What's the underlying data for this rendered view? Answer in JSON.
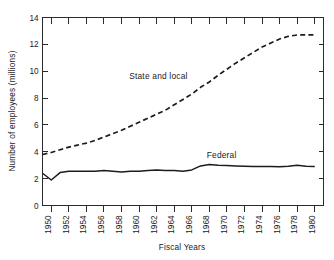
{
  "chart_data": {
    "type": "line",
    "title": "",
    "xlabel": "Fiscal Years",
    "ylabel": "Number of employees (millions)",
    "xlim": [
      1949,
      1981
    ],
    "ylim": [
      0,
      14
    ],
    "grid": false,
    "legend_position": "inline-annotation",
    "x_tick_labels": [
      "1950",
      "1952",
      "1954",
      "1956",
      "1958",
      "1960",
      "1962",
      "1964",
      "1966",
      "1968",
      "1970",
      "1972",
      "1974",
      "1976",
      "1978",
      "1980"
    ],
    "x_ticks": [
      1950,
      1952,
      1954,
      1956,
      1958,
      1960,
      1962,
      1964,
      1966,
      1968,
      1970,
      1972,
      1974,
      1976,
      1978,
      1980
    ],
    "y_tick_labels": [
      "0",
      "2",
      "4",
      "6",
      "8",
      "10",
      "12",
      "14"
    ],
    "y_ticks": [
      0,
      2,
      4,
      6,
      8,
      10,
      12,
      14
    ],
    "x": [
      1949,
      1950,
      1951,
      1952,
      1953,
      1954,
      1955,
      1956,
      1957,
      1958,
      1959,
      1960,
      1961,
      1962,
      1963,
      1964,
      1965,
      1966,
      1967,
      1968,
      1969,
      1970,
      1971,
      1972,
      1973,
      1974,
      1975,
      1976,
      1977,
      1978,
      1979,
      1980
    ],
    "series": [
      {
        "name": "State and local",
        "style": "dashed",
        "label_x": 1962.2,
        "label_y": 9.45,
        "values": [
          3.8,
          3.95,
          4.15,
          4.35,
          4.5,
          4.65,
          4.85,
          5.1,
          5.35,
          5.6,
          5.9,
          6.2,
          6.5,
          6.8,
          7.1,
          7.5,
          7.9,
          8.3,
          8.8,
          9.2,
          9.7,
          10.15,
          10.6,
          11.0,
          11.4,
          11.8,
          12.1,
          12.4,
          12.6,
          12.7,
          12.7,
          12.7
        ]
      },
      {
        "name": "Federal",
        "style": "solid",
        "label_x": 1969.4,
        "label_y": 3.55,
        "values": [
          2.4,
          1.9,
          2.45,
          2.55,
          2.55,
          2.55,
          2.55,
          2.6,
          2.55,
          2.5,
          2.55,
          2.55,
          2.6,
          2.65,
          2.6,
          2.6,
          2.55,
          2.65,
          2.95,
          3.05,
          3.0,
          2.98,
          2.95,
          2.92,
          2.9,
          2.9,
          2.9,
          2.88,
          2.92,
          3.0,
          2.92,
          2.9
        ]
      }
    ]
  },
  "axis": {
    "x_title": "Fiscal Years",
    "y_title": "Number of employees (millions)"
  }
}
